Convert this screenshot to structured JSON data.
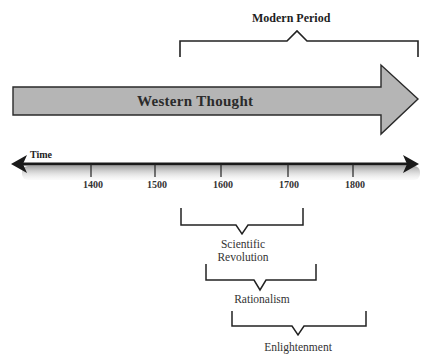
{
  "diagram": {
    "top_cut_text": "",
    "modern_period": {
      "label": "Modern Period",
      "bracket": {
        "left_x": 180,
        "right_x": 418,
        "top_y": 41,
        "leg_bottom_y": 57,
        "notch_x": 297,
        "notch_y": 31
      }
    },
    "main_arrow": {
      "label": "Western Thought",
      "fill_color": "#b5b5b5",
      "stroke_color": "#2a2a2a"
    },
    "timeline": {
      "axis_label": "Time",
      "ticks": [
        {
          "label": "1400",
          "x": 91
        },
        {
          "label": "1500",
          "x": 155
        },
        {
          "label": "1600",
          "x": 221
        },
        {
          "label": "1700",
          "x": 288
        },
        {
          "label": "1800",
          "x": 353
        }
      ],
      "line_color": "#1a1a1a",
      "shadow_color": "#bdbdbd"
    },
    "periods": [
      {
        "label_lines": [
          "Scientific",
          "Revolution"
        ],
        "left_x": 181,
        "right_x": 303,
        "top_y": 208,
        "base_y": 225,
        "notch_x": 242,
        "notch_y": 234
      },
      {
        "label_lines": [
          "Rationalism"
        ],
        "left_x": 206,
        "right_x": 316,
        "top_y": 264,
        "base_y": 280,
        "notch_x": 260,
        "notch_y": 290
      },
      {
        "label_lines": [
          "Enlightenment"
        ],
        "left_x": 232,
        "right_x": 366,
        "top_y": 311,
        "base_y": 326,
        "notch_x": 298,
        "notch_y": 335
      }
    ]
  }
}
